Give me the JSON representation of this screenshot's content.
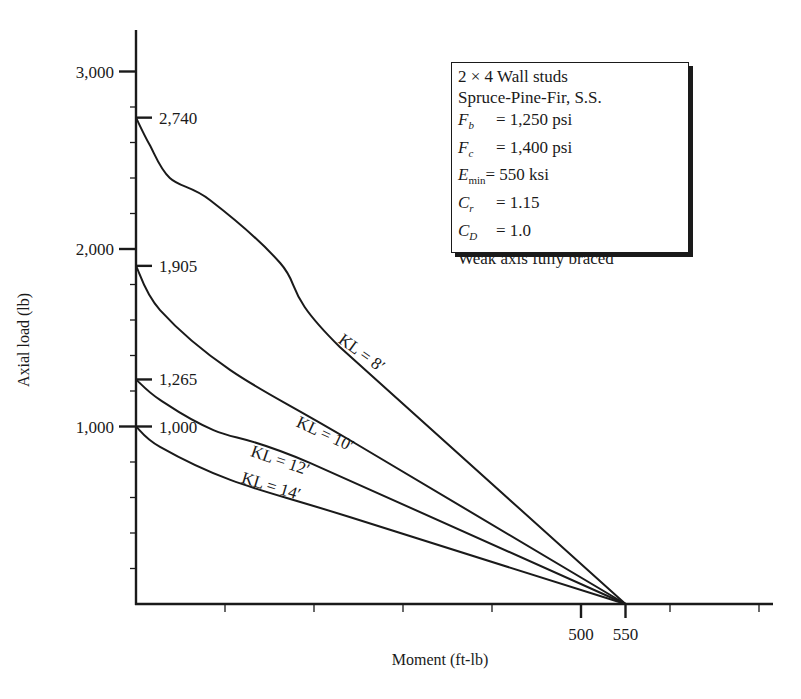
{
  "chart_data": {
    "type": "line",
    "title": "",
    "xlabel": "Moment (ft-lb)",
    "ylabel": "Axial load (lb)",
    "xlim": [
      0,
      700
    ],
    "ylim": [
      0,
      3200
    ],
    "grid": false,
    "x_ticks": [
      0,
      100,
      200,
      300,
      400,
      500,
      550,
      600,
      700
    ],
    "x_tick_labels": [
      {
        "value": 500,
        "label": "500"
      },
      {
        "value": 550,
        "label": "550"
      }
    ],
    "y_major_ticks": [
      {
        "value": 1000,
        "label": "1,000"
      },
      {
        "value": 2000,
        "label": "2,000"
      },
      {
        "value": 3000,
        "label": "3,000"
      }
    ],
    "y_minor_ticks": [
      200,
      400,
      600,
      800,
      1200,
      1400,
      1600,
      1800,
      2200,
      2400,
      2600,
      2800
    ],
    "y_annotations": [
      {
        "value": 2740,
        "label": "2,740"
      },
      {
        "value": 1905,
        "label": "1,905"
      },
      {
        "value": 1265,
        "label": "1,265"
      },
      {
        "value": 1000,
        "label": "1,000"
      }
    ],
    "series": [
      {
        "name": "KL = 8′",
        "label": "KL = 8′",
        "points": [
          [
            0,
            2740
          ],
          [
            15,
            2590
          ],
          [
            38,
            2400
          ],
          [
            83,
            2276
          ],
          [
            162,
            1921
          ],
          [
            229,
            1448
          ],
          [
            550,
            0
          ]
        ],
        "label_pos": [
          250,
          1390
        ],
        "label_angle": 36
      },
      {
        "name": "KL = 10′",
        "label": "KL = 10′",
        "points": [
          [
            0,
            1905
          ],
          [
            27,
            1656
          ],
          [
            106,
            1318
          ],
          [
            240,
            924
          ],
          [
            550,
            0
          ]
        ],
        "label_pos": [
          210,
          930
        ],
        "label_angle": 25
      },
      {
        "name": "KL = 12′",
        "label": "KL = 12′",
        "points": [
          [
            0,
            1265
          ],
          [
            27,
            1150
          ],
          [
            87,
            980
          ],
          [
            196,
            794
          ],
          [
            550,
            0
          ]
        ],
        "label_pos": [
          160,
          780
        ],
        "label_angle": 19
      },
      {
        "name": "KL = 14′",
        "label": "KL = 14′",
        "points": [
          [
            0,
            1000
          ],
          [
            27,
            885
          ],
          [
            106,
            699
          ],
          [
            240,
            490
          ],
          [
            550,
            0
          ]
        ],
        "label_pos": [
          150,
          635
        ],
        "label_angle": 17
      }
    ],
    "legend": {
      "position": "top-right",
      "lines": [
        "2 × 4 Wall studs",
        "Spruce-Pine-Fir, S.S.",
        "Fb = 1,250 psi",
        "Fc = 1,400 psi",
        "Emin = 550 ksi",
        "Cr = 1.15",
        "CD = 1.0",
        "Weak axis fully braced"
      ]
    }
  },
  "legend": {
    "line1": "2 × 4 Wall studs",
    "line2": "Spruce-Pine-Fir, S.S.",
    "fb_sym": "F",
    "fb_sub": "b",
    "fb_val": "= 1,250 psi",
    "fc_sym": "F",
    "fc_sub": "c",
    "fc_val": "= 1,400 psi",
    "emin_sym": "E",
    "emin_sub": "min",
    "emin_val": "= 550 ksi",
    "cr_sym": "C",
    "cr_sub": "r",
    "cr_val": "= 1.15",
    "cd_sym": "C",
    "cd_sub": "D",
    "cd_val": "= 1.0",
    "line8": "Weak axis fully braced"
  },
  "axes": {
    "xlabel": "Moment (ft-lb)",
    "ylabel": "Axial load (lb)"
  },
  "colors": {
    "ink": "#1a1a1a",
    "background": "#ffffff"
  }
}
